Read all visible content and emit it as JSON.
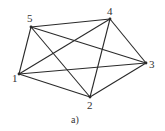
{
  "diagram": {
    "type": "complete-graph",
    "caption": "a)",
    "vertices": [
      {
        "id": "1",
        "label": "1",
        "x": 19,
        "y": 74,
        "lx": 12,
        "ly": 82
      },
      {
        "id": "2",
        "label": "2",
        "x": 90,
        "y": 97,
        "lx": 87,
        "ly": 109
      },
      {
        "id": "3",
        "label": "3",
        "x": 146,
        "y": 63,
        "lx": 149,
        "ly": 68
      },
      {
        "id": "4",
        "label": "4",
        "x": 110,
        "y": 19,
        "lx": 107,
        "ly": 15
      },
      {
        "id": "5",
        "label": "5",
        "x": 31,
        "y": 27,
        "lx": 27,
        "ly": 22
      }
    ],
    "edges": [
      [
        "1",
        "2"
      ],
      [
        "1",
        "3"
      ],
      [
        "1",
        "4"
      ],
      [
        "1",
        "5"
      ],
      [
        "2",
        "3"
      ],
      [
        "2",
        "4"
      ],
      [
        "2",
        "5"
      ],
      [
        "3",
        "4"
      ],
      [
        "3",
        "5"
      ],
      [
        "4",
        "5"
      ]
    ]
  }
}
